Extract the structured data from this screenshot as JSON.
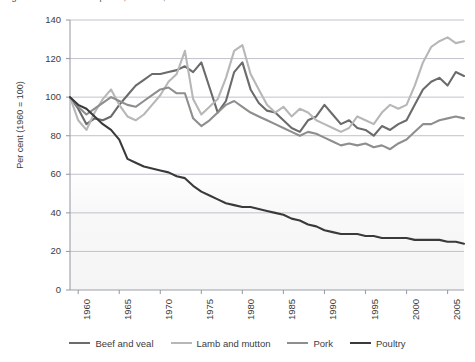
{
  "chart_data": {
    "type": "line",
    "title": "Figure 1: Relative meat prices, Australia, 1960 to 2007",
    "xlabel": "",
    "ylabel": "Per cent (1960 = 100)",
    "ylim": [
      0,
      140
    ],
    "ytick_step": 20,
    "yticks": [
      0,
      20,
      40,
      60,
      80,
      100,
      120,
      140
    ],
    "xlim": [
      1959,
      2007
    ],
    "xticks": [
      1960,
      1965,
      1970,
      1975,
      1980,
      1985,
      1990,
      1995,
      2000,
      2005
    ],
    "xtick_labels": [
      "1960",
      "1965",
      "1970",
      "1975",
      "1980",
      "1985",
      "1990",
      "1995",
      "2000",
      "2005"
    ],
    "grid": "horizontal",
    "legend_position": "bottom",
    "x": [
      1959,
      1960,
      1961,
      1962,
      1963,
      1964,
      1965,
      1966,
      1967,
      1968,
      1969,
      1970,
      1971,
      1972,
      1973,
      1974,
      1975,
      1976,
      1977,
      1978,
      1979,
      1980,
      1981,
      1982,
      1983,
      1984,
      1985,
      1986,
      1987,
      1988,
      1989,
      1990,
      1991,
      1992,
      1993,
      1994,
      1995,
      1996,
      1997,
      1998,
      1999,
      2000,
      2001,
      2002,
      2003,
      2004,
      2005,
      2006,
      2007
    ],
    "series": [
      {
        "name": "Beef and veal",
        "color": "#6b6b6b",
        "values": [
          100,
          94,
          86,
          89,
          88,
          90,
          96,
          101,
          106,
          109,
          112,
          112,
          113,
          114,
          116,
          113,
          118,
          105,
          92,
          98,
          113,
          118,
          104,
          97,
          93,
          92,
          88,
          84,
          82,
          88,
          90,
          96,
          91,
          86,
          88,
          84,
          83,
          80,
          85,
          83,
          86,
          88,
          96,
          104,
          108,
          110,
          106,
          113,
          111
        ]
      },
      {
        "name": "Lamb and mutton",
        "color": "#b7b7b7",
        "values": [
          100,
          88,
          83,
          92,
          99,
          104,
          96,
          90,
          88,
          91,
          96,
          101,
          108,
          112,
          124,
          99,
          91,
          95,
          99,
          110,
          124,
          127,
          112,
          104,
          96,
          92,
          95,
          90,
          94,
          92,
          88,
          86,
          84,
          82,
          84,
          90,
          88,
          86,
          92,
          96,
          94,
          96,
          106,
          118,
          126,
          129,
          131,
          128,
          129
        ]
      },
      {
        "name": "Pork",
        "color": "#8e8e8e",
        "values": [
          100,
          95,
          91,
          94,
          97,
          100,
          98,
          96,
          95,
          98,
          101,
          104,
          105,
          102,
          102,
          89,
          85,
          88,
          92,
          96,
          98,
          95,
          92,
          90,
          88,
          86,
          84,
          82,
          80,
          82,
          81,
          79,
          77,
          75,
          76,
          75,
          76,
          74,
          75,
          73,
          76,
          78,
          82,
          86,
          86,
          88,
          89,
          90,
          89
        ]
      },
      {
        "name": "Poultry",
        "color": "#3a3a3a",
        "values": [
          100,
          96,
          94,
          90,
          86,
          83,
          78,
          68,
          66,
          64,
          63,
          62,
          61,
          59,
          58,
          54,
          51,
          49,
          47,
          45,
          44,
          43,
          43,
          42,
          41,
          40,
          39,
          37,
          36,
          34,
          33,
          31,
          30,
          29,
          29,
          29,
          28,
          28,
          27,
          27,
          27,
          27,
          26,
          26,
          26,
          26,
          25,
          25,
          24
        ]
      }
    ]
  },
  "axis": {
    "y_title": "Per cent (1960 = 100)",
    "y_labels": [
      "140",
      "120",
      "100",
      "80",
      "60",
      "40",
      "20",
      "0"
    ],
    "x_labels": [
      "1960",
      "1965",
      "1970",
      "1975",
      "1980",
      "1985",
      "1990",
      "1995",
      "2000",
      "2005"
    ]
  },
  "legend": {
    "items": [
      {
        "label": "Beef and veal",
        "color": "#6b6b6b"
      },
      {
        "label": "Lamb and mutton",
        "color": "#b7b7b7"
      },
      {
        "label": "Pork",
        "color": "#8e8e8e"
      },
      {
        "label": "Poultry",
        "color": "#3a3a3a"
      }
    ]
  },
  "colors": {
    "grid": "#b9bcc4",
    "axis": "#9aa0a8",
    "text": "#3c3c3c",
    "plot_background": "#ffffff"
  }
}
